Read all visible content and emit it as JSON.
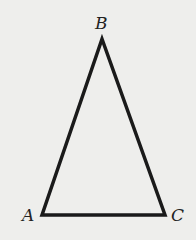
{
  "diagram": {
    "type": "triangle",
    "vertices": [
      {
        "label": "A",
        "x": 42,
        "y": 215
      },
      {
        "label": "B",
        "x": 102,
        "y": 39
      },
      {
        "label": "C",
        "x": 165,
        "y": 215
      }
    ],
    "labels": {
      "A": "A",
      "B": "B",
      "C": "C"
    },
    "stroke_color": "#1a1a1a",
    "background": "#eeeeec"
  }
}
